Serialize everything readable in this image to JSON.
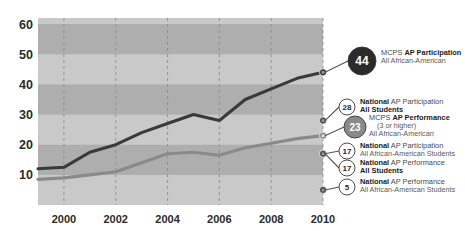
{
  "chart_data": {
    "type": "line",
    "title": "",
    "xlabel": "",
    "ylabel": "",
    "xlim": [
      1999,
      2010
    ],
    "ylim": [
      0,
      62
    ],
    "grid": true,
    "grid_style": "dashed-vertical-plus-horizontal-bands",
    "legend_position": "right",
    "x": [
      1999,
      2000,
      2001,
      2002,
      2003,
      2004,
      2005,
      2006,
      2007,
      2008,
      2009,
      2010
    ],
    "xtick_labels": [
      "2000",
      "2002",
      "2004",
      "2006",
      "2008",
      "2010"
    ],
    "xtick_values": [
      2000,
      2002,
      2004,
      2006,
      2008,
      2010
    ],
    "ytick_labels": [
      "10",
      "20",
      "30",
      "40",
      "50",
      "60"
    ],
    "ytick_values": [
      10,
      20,
      30,
      40,
      50,
      60
    ],
    "series": [
      {
        "name": "MCPS AP Participation All African-American",
        "color": "#3a3a3a",
        "end_value": 44,
        "values": [
          12.0,
          12.5,
          17.5,
          20.0,
          24.0,
          27.0,
          30.0,
          28.0,
          35.0,
          38.5,
          42.0,
          44.0
        ]
      },
      {
        "name": "MCPS AP Performance (3 or higher) All African-American",
        "color": "#8a8a8a",
        "end_value": 23,
        "values": [
          8.5,
          9.0,
          10.0,
          11.0,
          14.0,
          17.0,
          17.5,
          16.5,
          19.0,
          20.5,
          22.0,
          23.0
        ]
      }
    ],
    "reference_markers": [
      {
        "label": "28",
        "value": 28
      },
      {
        "label": "23",
        "value": 23
      },
      {
        "label": "17",
        "value": 17
      },
      {
        "label": "17",
        "value": 17
      },
      {
        "label": "5",
        "value": 5
      }
    ]
  },
  "legend": {
    "items": [
      {
        "badge": "44",
        "badge_fill": "#2b2b2b",
        "badge_text_color": "#ffffff",
        "badge_radius": 14,
        "badge_font_size": 12,
        "value": 44,
        "line1_strong": "MCPS ",
        "line1_bold": "AP Participation",
        "line2": "All African-American",
        "line3": ""
      },
      {
        "badge": "28",
        "badge_fill": "#ffffff",
        "badge_text_color": "#2b2b2b",
        "badge_radius": 8,
        "badge_font_size": 8,
        "value": 28,
        "line1_strong": "National",
        "line1_bold": " AP Participation",
        "line2": "All Students",
        "line3": ""
      },
      {
        "badge": "23",
        "badge_fill": "#8a8a8a",
        "badge_text_color": "#ffffff",
        "badge_radius": 11,
        "badge_font_size": 10,
        "value": 23,
        "line1_strong": "MCPS ",
        "line1_bold": "AP Performance",
        "line2": "(3 or higher)",
        "line3": "All African-American"
      },
      {
        "badge": "17",
        "badge_fill": "#ffffff",
        "badge_text_color": "#2b2b2b",
        "badge_radius": 8,
        "badge_font_size": 8,
        "value": 17,
        "line1_strong": "National",
        "line1_bold": " AP Participation",
        "line2": "All African-American Students",
        "line3": ""
      },
      {
        "badge": "17",
        "badge_fill": "#ffffff",
        "badge_text_color": "#2b2b2b",
        "badge_radius": 8,
        "badge_font_size": 8,
        "value": 17,
        "line1_strong": "National",
        "line1_bold": " AP Performance",
        "line2": "All Students",
        "line3": ""
      },
      {
        "badge": "5",
        "badge_fill": "#ffffff",
        "badge_text_color": "#2b2b2b",
        "badge_radius": 8,
        "badge_font_size": 8,
        "value": 5,
        "line1_strong": "National",
        "line1_bold": " AP Performance",
        "line2": "All African-American Students",
        "line3": ""
      }
    ]
  },
  "colors": {
    "band_light": "#c9c9c9",
    "band_dark": "#aeaeae",
    "plot_bg": "#bdbdbd",
    "gridline": "#8f8f8f",
    "dark_series": "#3a3a3a",
    "gray_series": "#8a8a8a",
    "axis_text": "#2b2b2b",
    "page_bg": "#ffffff"
  }
}
